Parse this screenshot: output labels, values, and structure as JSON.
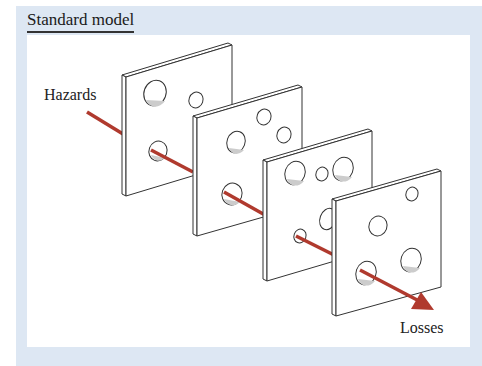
{
  "title": "Standard model",
  "labels": {
    "input": "Hazards",
    "output": "Losses"
  },
  "colors": {
    "frame_bg": "#dde7f3",
    "panel_bg": "#ffffff",
    "arrow": "#b03a2e",
    "outline": "#333333",
    "hole_shade": "#c8c8c8"
  },
  "diagram": {
    "type": "swiss-cheese-model",
    "slices": 4,
    "arrow_passes_through_all": true
  }
}
